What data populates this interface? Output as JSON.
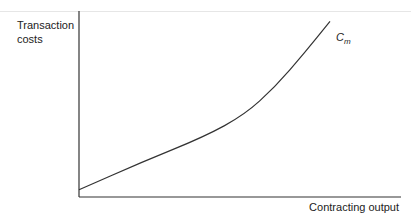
{
  "chart_data": {
    "type": "line",
    "title": "",
    "xlabel": "Contracting output",
    "ylabel": "Transaction costs",
    "series": [
      {
        "name": "Cm",
        "x": [
          0,
          0.25,
          0.5,
          0.66,
          0.78,
          0.9,
          1.0
        ],
        "values": [
          0.04,
          0.19,
          0.33,
          0.45,
          0.6,
          0.79,
          0.96
        ]
      }
    ],
    "curve_label": {
      "main": "C",
      "sub": "m"
    },
    "grid": false,
    "ticks": false
  }
}
